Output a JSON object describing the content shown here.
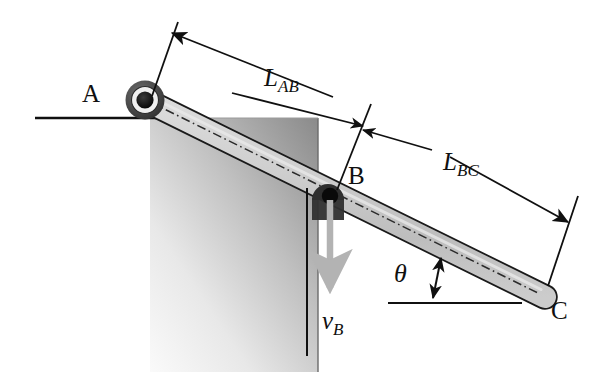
{
  "figure": {
    "kind": "engineering-mechanism-diagram",
    "background_color": "#ffffff",
    "ink_color": "#101010"
  },
  "labels": {
    "point_a": "A",
    "point_b": "B",
    "point_c": "C",
    "length_ab": {
      "base": "L",
      "sub": "AB"
    },
    "length_bc": {
      "base": "L",
      "sub": "BC"
    },
    "velocity_b": {
      "base": "v",
      "sub": "B"
    },
    "angle_theta": "θ"
  },
  "geometry": {
    "pivot_a": {
      "x": 145,
      "y": 100
    },
    "contact_b": {
      "x": 330,
      "y": 196
    },
    "end_c": {
      "x": 545,
      "y": 297
    },
    "rod_angle_deg": 26,
    "rod_half_width": 11,
    "ground_line": {
      "x1": 35,
      "y1": 118,
      "x2": 160,
      "y2": 118
    },
    "theta_reference_line": {
      "x1": 388,
      "y1": 303,
      "x2": 520,
      "y2": 303
    },
    "corner_block": {
      "left": 150,
      "top": 118,
      "right": 318,
      "bottom": 372
    }
  },
  "colors": {
    "rod_fill": "#c9c9c9",
    "rod_fill_light": "#e2e2e2",
    "rod_outline": "#1a1a1a",
    "centerline": "#2b2b2b",
    "pivot_ring_outer": "#4a4a4a",
    "pivot_ring_inner": "#f0f0f0",
    "pivot_hub": "#111111",
    "block_light": "#f2f2f2",
    "block_dark": "#8e8e8e",
    "velocity_arrow": "#b3b3b3",
    "dimension_line": "#101010"
  },
  "annotations": {
    "dimension_ab": "Dimension arrow spanning from extension line at A to extension line at B",
    "dimension_bc": "Dimension arrow spanning from extension line at B to extension line at C",
    "velocity_vector": "Downward gray arrow at B representing velocity v_B",
    "angle_marker": "Double headed vertical arrow between horizontal reference and rod marking angle theta"
  }
}
